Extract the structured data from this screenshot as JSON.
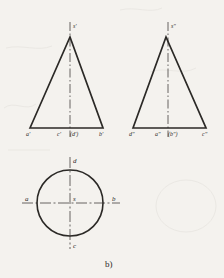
{
  "figure": {
    "caption": "b)",
    "background_color": "#f4f2ee",
    "line_color": "#2b2926",
    "center_line_color": "#555250",
    "views": [
      {
        "id": "front-view",
        "name": "front-view-triangle",
        "shape": "triangle",
        "apex_label": "s'",
        "base_labels": [
          "a'",
          "c'",
          "(d')",
          "b'"
        ],
        "apex": {
          "x": 70,
          "y": 37
        },
        "base_left": {
          "x": 30,
          "y": 128
        },
        "base_right": {
          "x": 103,
          "y": 128
        },
        "axis_top": {
          "x": 70,
          "y": 22
        },
        "axis_bottom": {
          "x": 70,
          "y": 137
        }
      },
      {
        "id": "side-view",
        "name": "side-view-triangle",
        "shape": "triangle",
        "apex_label": "s\"",
        "base_labels": [
          "d\"",
          "a\"",
          "(b\")",
          "c\""
        ],
        "apex": {
          "x": 166,
          "y": 37
        },
        "base_left": {
          "x": 133,
          "y": 128
        },
        "base_right": {
          "x": 206,
          "y": 128
        },
        "axis_top": {
          "x": 168,
          "y": 22
        },
        "axis_bottom": {
          "x": 168,
          "y": 137
        }
      },
      {
        "id": "top-view",
        "name": "top-view-circle",
        "shape": "circle",
        "center_label": "s",
        "point_labels": [
          "a",
          "b",
          "d",
          "c"
        ],
        "center": {
          "x": 70,
          "y": 203
        },
        "radius": 33,
        "h_axis_left": {
          "x": 22,
          "y": 203
        },
        "h_axis_right": {
          "x": 120,
          "y": 203
        },
        "v_axis_top": {
          "x": 70,
          "y": 157
        },
        "v_axis_bottom": {
          "x": 70,
          "y": 249
        }
      }
    ],
    "labels": [
      {
        "name": "label-s-prime",
        "text": "s'",
        "x": 73,
        "y": 23,
        "size": "small"
      },
      {
        "name": "label-a-prime",
        "text": "a'",
        "x": 26,
        "y": 131,
        "size": "small"
      },
      {
        "name": "label-c-prime",
        "text": "c'",
        "x": 57,
        "y": 131,
        "size": "small"
      },
      {
        "name": "label-d-prime-hidden",
        "text": "(d')",
        "x": 70,
        "y": 131,
        "size": "small"
      },
      {
        "name": "label-b-prime",
        "text": "b'",
        "x": 99,
        "y": 131,
        "size": "small"
      },
      {
        "name": "label-s-double-prime",
        "text": "s\"",
        "x": 171,
        "y": 23,
        "size": "small"
      },
      {
        "name": "label-d-double-prime",
        "text": "d\"",
        "x": 129,
        "y": 131,
        "size": "small"
      },
      {
        "name": "label-a-double-prime",
        "text": "a\"",
        "x": 155,
        "y": 131,
        "size": "small"
      },
      {
        "name": "label-b-double-prime-hidden",
        "text": "(b\")",
        "x": 168,
        "y": 131,
        "size": "small"
      },
      {
        "name": "label-c-double-prime",
        "text": "c\"",
        "x": 202,
        "y": 131,
        "size": "small"
      },
      {
        "name": "label-d-top",
        "text": "d",
        "x": 73,
        "y": 158,
        "size": "norm"
      },
      {
        "name": "label-a-left",
        "text": "a",
        "x": 25,
        "y": 196,
        "size": "norm"
      },
      {
        "name": "label-s-center",
        "text": "s",
        "x": 73,
        "y": 196,
        "size": "norm"
      },
      {
        "name": "label-b-right",
        "text": "b",
        "x": 112,
        "y": 196,
        "size": "norm"
      },
      {
        "name": "label-c-bottom",
        "text": "c",
        "x": 73,
        "y": 243,
        "size": "norm"
      }
    ],
    "caption_pos": {
      "x": 105,
      "y": 259
    }
  }
}
